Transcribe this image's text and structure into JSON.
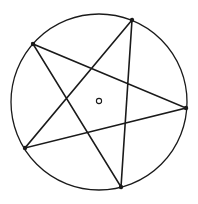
{
  "figure": {
    "width": 198,
    "height": 204,
    "background": "#ffffff",
    "stroke_color": "#1a1a1a",
    "circle": {
      "cx": 99,
      "cy": 102,
      "r": 88,
      "stroke_width": 1.3
    },
    "center_point": {
      "cx": 99,
      "cy": 101,
      "r": 2.6,
      "stroke_width": 1.1
    },
    "vertices": [
      {
        "name": "top",
        "x": 132,
        "y": 20
      },
      {
        "name": "right",
        "x": 186,
        "y": 108
      },
      {
        "name": "bottom",
        "x": 121,
        "y": 187
      },
      {
        "name": "left-lower",
        "x": 25,
        "y": 148
      },
      {
        "name": "left-upper",
        "x": 33,
        "y": 44
      }
    ],
    "star_order": [
      0,
      3,
      1,
      4,
      2
    ],
    "star_stroke_width": 1.6,
    "vertex_dot_radius": 2.2
  }
}
